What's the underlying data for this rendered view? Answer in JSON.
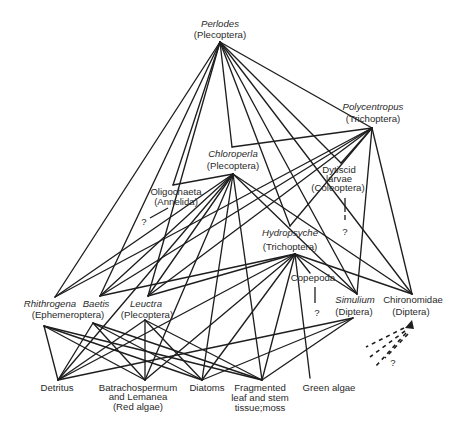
{
  "diagram": {
    "type": "food-web",
    "nodes": {
      "perlodes": {
        "name": "Perlodes",
        "group": "(Plecoptera)"
      },
      "polycentropus": {
        "name": "Polycentropus",
        "group": "(Trichoptera)"
      },
      "chloroperla": {
        "name": "Chloroperla",
        "group": "(Plecoptera)"
      },
      "dytiscid": {
        "line1": "Dytiscid",
        "line2": "larvae",
        "group": "(Coleoptera)"
      },
      "oligochaeta": {
        "name": "Oligochaeta",
        "group": "(Annelida)"
      },
      "hydropsyche": {
        "name": "Hydropsyche",
        "group": "(Trichoptera)"
      },
      "copepoda": {
        "name": "Copepoda"
      },
      "rhithrogena": {
        "name": "Rhithrogena",
        "group": "(Ephemeroptera)"
      },
      "baetis": {
        "name": "Baetis"
      },
      "leuctra": {
        "name": "Leuctra",
        "group": "(Plecoptera)"
      },
      "simulium": {
        "name": "Simulium",
        "group": "(Diptera)"
      },
      "chironomidae": {
        "name": "Chironomidae",
        "group": "(Diptera)"
      },
      "detritus": {
        "name": "Detritus"
      },
      "batrachospermum": {
        "line1": "Batrachospermum",
        "line2": "and Lemanea",
        "line3": "(Red algae)"
      },
      "diatoms": {
        "name": "Diatoms"
      },
      "fragmented": {
        "line1": "Fragmented",
        "line2": "leaf and stem",
        "line3": "tissue;moss"
      },
      "green_algae": {
        "name": "Green algae"
      }
    },
    "unknown_marker": "?",
    "anchors": {
      "perlodes": [
        220,
        42
      ],
      "polycentropus": [
        372,
        128
      ],
      "chloroperla_in": [
        232,
        147
      ],
      "chloroperla": [
        233,
        174
      ],
      "dytiscid": [
        341,
        163
      ],
      "oligochaeta": [
        173,
        185
      ],
      "hydropsyche_in": [
        290,
        226
      ],
      "hydropsyche": [
        295,
        254
      ],
      "copepoda_in": [
        310,
        273
      ],
      "rhithrogena_in": [
        55,
        297
      ],
      "rhithrogena": [
        44,
        326
      ],
      "baetis_in": [
        100,
        296
      ],
      "baetis": [
        93,
        323
      ],
      "leuctra_in": [
        148,
        296
      ],
      "leuctra": [
        145,
        320
      ],
      "simulium_in": [
        357,
        294
      ],
      "simulium": [
        353,
        318
      ],
      "chironomidae_in": [
        412,
        294
      ],
      "detritus": [
        58,
        380
      ],
      "batrachospermum": [
        145,
        380
      ],
      "diatoms": [
        202,
        380
      ],
      "fragmented": [
        262,
        380
      ],
      "green_algae": [
        310,
        378
      ]
    },
    "edges": [
      [
        "perlodes",
        "chloroperla_in"
      ],
      [
        "perlodes",
        "polycentropus"
      ],
      [
        "perlodes",
        "rhithrogena_in"
      ],
      [
        "perlodes",
        "baetis_in"
      ],
      [
        "perlodes",
        "leuctra_in"
      ],
      [
        "perlodes",
        "oligochaeta"
      ],
      [
        "perlodes",
        "hydropsyche_in"
      ],
      [
        "perlodes",
        "dytiscid"
      ],
      [
        "perlodes",
        "simulium_in"
      ],
      [
        "perlodes",
        "chironomidae_in"
      ],
      [
        "polycentropus",
        "chloroperla_in"
      ],
      [
        "polycentropus",
        "dytiscid"
      ],
      [
        "polycentropus",
        "rhithrogena_in"
      ],
      [
        "polycentropus",
        "baetis_in"
      ],
      [
        "polycentropus",
        "leuctra_in"
      ],
      [
        "polycentropus",
        "hydropsyche_in"
      ],
      [
        "polycentropus",
        "simulium_in"
      ],
      [
        "polycentropus",
        "chironomidae_in"
      ],
      [
        "chloroperla",
        "oligochaeta"
      ],
      [
        "chloroperla",
        "rhithrogena_in"
      ],
      [
        "chloroperla",
        "baetis_in"
      ],
      [
        "chloroperla",
        "leuctra_in"
      ],
      [
        "chloroperla",
        "detritus"
      ],
      [
        "chloroperla",
        "batrachospermum"
      ],
      [
        "chloroperla",
        "diatoms"
      ],
      [
        "chloroperla",
        "fragmented"
      ],
      [
        "chloroperla",
        "simulium_in"
      ],
      [
        "chloroperla",
        "chironomidae_in"
      ],
      [
        "hydropsyche",
        "copepoda_in"
      ],
      [
        "hydropsyche",
        "baetis_in"
      ],
      [
        "hydropsyche",
        "leuctra_in"
      ],
      [
        "hydropsyche",
        "simulium_in"
      ],
      [
        "hydropsyche",
        "chironomidae_in"
      ],
      [
        "hydropsyche",
        "detritus"
      ],
      [
        "hydropsyche",
        "batrachospermum"
      ],
      [
        "hydropsyche",
        "diatoms"
      ],
      [
        "hydropsyche",
        "fragmented"
      ],
      [
        "hydropsyche",
        "green_algae"
      ],
      [
        "rhithrogena",
        "detritus"
      ],
      [
        "rhithrogena",
        "batrachospermum"
      ],
      [
        "rhithrogena",
        "diatoms"
      ],
      [
        "rhithrogena",
        "fragmented"
      ],
      [
        "baetis",
        "detritus"
      ],
      [
        "baetis",
        "batrachospermum"
      ],
      [
        "baetis",
        "diatoms"
      ],
      [
        "baetis",
        "fragmented"
      ],
      [
        "leuctra",
        "detritus"
      ],
      [
        "leuctra",
        "batrachospermum"
      ],
      [
        "leuctra",
        "diatoms"
      ],
      [
        "leuctra",
        "fragmented"
      ],
      [
        "simulium",
        "diatoms"
      ],
      [
        "simulium",
        "fragmented"
      ],
      [
        "simulium",
        "detritus"
      ]
    ]
  }
}
